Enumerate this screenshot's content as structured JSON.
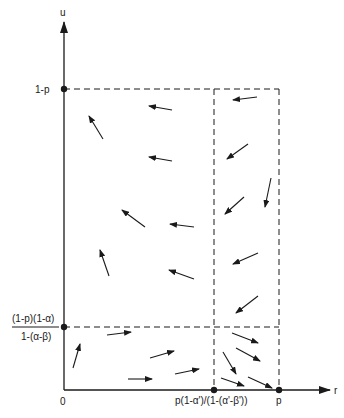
{
  "diagram": {
    "type": "phase-portrait",
    "axes": {
      "x_label": "r",
      "y_label": "u",
      "origin_label": "0"
    },
    "x_ticks": [
      {
        "label": "p(1-α')/(1-(α'-β'))",
        "x": 214
      },
      {
        "label": "p",
        "x": 279
      }
    ],
    "y_ticks": [
      {
        "label": "1-p",
        "y": 89
      },
      {
        "numerator": "(1-p)(1-α)",
        "denominator": "1-(α-β)",
        "y": 327
      }
    ],
    "arrows": [
      {
        "x1": 103,
        "y1": 139,
        "x2": 89,
        "y2": 116
      },
      {
        "x1": 172,
        "y1": 110,
        "x2": 149,
        "y2": 106
      },
      {
        "x1": 172,
        "y1": 161,
        "x2": 149,
        "y2": 157
      },
      {
        "x1": 145,
        "y1": 227,
        "x2": 122,
        "y2": 210
      },
      {
        "x1": 109,
        "y1": 276,
        "x2": 100,
        "y2": 250
      },
      {
        "x1": 194,
        "y1": 279,
        "x2": 169,
        "y2": 270
      },
      {
        "x1": 194,
        "y1": 227,
        "x2": 170,
        "y2": 224
      },
      {
        "x1": 257,
        "y1": 97,
        "x2": 233,
        "y2": 100
      },
      {
        "x1": 248,
        "y1": 144,
        "x2": 227,
        "y2": 159
      },
      {
        "x1": 271,
        "y1": 178,
        "x2": 265,
        "y2": 207
      },
      {
        "x1": 244,
        "y1": 197,
        "x2": 225,
        "y2": 214
      },
      {
        "x1": 258,
        "y1": 253,
        "x2": 233,
        "y2": 264
      },
      {
        "x1": 258,
        "y1": 296,
        "x2": 236,
        "y2": 313
      },
      {
        "x1": 73,
        "y1": 368,
        "x2": 80,
        "y2": 344
      },
      {
        "x1": 107,
        "y1": 335,
        "x2": 131,
        "y2": 332
      },
      {
        "x1": 150,
        "y1": 358,
        "x2": 174,
        "y2": 351
      },
      {
        "x1": 128,
        "y1": 379,
        "x2": 152,
        "y2": 379
      },
      {
        "x1": 175,
        "y1": 374,
        "x2": 199,
        "y2": 369
      },
      {
        "x1": 232,
        "y1": 333,
        "x2": 258,
        "y2": 343
      },
      {
        "x1": 236,
        "y1": 348,
        "x2": 260,
        "y2": 361
      },
      {
        "x1": 223,
        "y1": 352,
        "x2": 236,
        "y2": 374
      },
      {
        "x1": 221,
        "y1": 378,
        "x2": 244,
        "y2": 386
      },
      {
        "x1": 248,
        "y1": 377,
        "x2": 272,
        "y2": 388
      }
    ],
    "colors": {
      "ink": "#1a1a1a",
      "background": "#ffffff"
    }
  }
}
